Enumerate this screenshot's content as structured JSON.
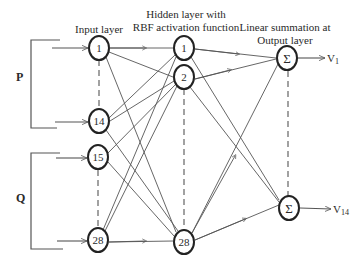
{
  "diagram": {
    "type": "RBF neural network architecture",
    "headers": {
      "input": "Input layer",
      "hidden_line1": "Hidden layer with",
      "hidden_line2": "RBF activation function",
      "output_line1": "Linear summation at",
      "output_line2": "Output layer"
    },
    "groups": {
      "p": "P",
      "q": "Q"
    },
    "input_nodes": [
      "1",
      "14",
      "15",
      "28"
    ],
    "hidden_nodes": [
      "1",
      "2",
      "28"
    ],
    "output_nodes": [
      "Σ",
      "Σ"
    ],
    "outputs": {
      "v1_base": "V",
      "v1_sub": "1",
      "v14_base": "V",
      "v14_sub": "14"
    },
    "colors": {
      "stroke": "#2a2a2a",
      "line": "#555555",
      "background": "#ffffff"
    }
  }
}
